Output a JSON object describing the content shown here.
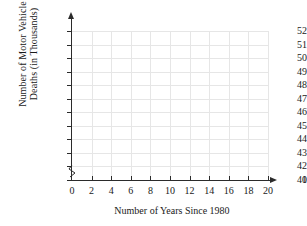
{
  "chart_data": {
    "type": "scatter",
    "title": "",
    "xlabel": "Number of Years Since 1980",
    "ylabel_lines": [
      "Number of Motor Vehicle",
      "Deaths (in Thousands)"
    ],
    "ylabel": "Number of Motor Vehicle Deaths (in Thousands)",
    "x": [],
    "values": [],
    "series": [],
    "xticks": [
      0,
      2,
      4,
      6,
      8,
      10,
      12,
      14,
      16,
      18,
      20
    ],
    "xtick_labels": [
      "0",
      "2",
      "4",
      "6",
      "8",
      "10",
      "12",
      "14",
      "16",
      "18",
      "20"
    ],
    "yticks": [
      0,
      41,
      42,
      43,
      44,
      45,
      46,
      47,
      48,
      49,
      50,
      51,
      52
    ],
    "ytick_labels": [
      "0",
      "41",
      "42",
      "43",
      "44",
      "45",
      "46",
      "47",
      "48",
      "49",
      "50",
      "51",
      "52"
    ],
    "xlim": [
      0,
      20
    ],
    "ylim": [
      41,
      52
    ],
    "grid": true,
    "legend": "none",
    "y_axis_break": true,
    "y_axis_break_between": [
      0,
      41
    ],
    "annotations": []
  },
  "style": {
    "background": "#ffffff",
    "axis_color": "#2b2b2b",
    "grid_color": "#e6e6e6",
    "text_color": "#1a1a1a"
  }
}
